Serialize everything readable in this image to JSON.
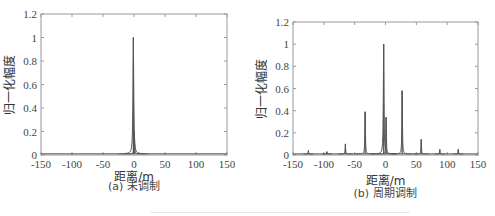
{
  "chart_data": [
    {
      "type": "line",
      "panel": "a",
      "caption": "(a) 未调制",
      "title": "",
      "xlabel": "距离/m",
      "ylabel": "归一化幅度",
      "xlim": [
        -150,
        150
      ],
      "ylim": [
        0,
        1.2
      ],
      "xticks": [
        "-150",
        "-100",
        "-50",
        "0",
        "50",
        "100",
        "150"
      ],
      "yticks": [
        "0",
        "0.2",
        "0.4",
        "0.6",
        "0.8",
        "1",
        "1.2"
      ],
      "grid": false,
      "peaks": [
        {
          "x": -1,
          "y": 1.0,
          "width": 6
        },
        {
          "x": 0.5,
          "y": 0.2,
          "width": 4
        }
      ]
    },
    {
      "type": "line",
      "panel": "b",
      "caption": "(b) 周期调制",
      "title": "",
      "xlabel": "距离/m",
      "ylabel": "归一化幅度",
      "xlim": [
        -150,
        150
      ],
      "ylim": [
        0,
        1.2
      ],
      "xticks": [
        "-150",
        "-100",
        "-50",
        "0",
        "50",
        "100",
        "150"
      ],
      "yticks": [
        "0",
        "0.2",
        "0.4",
        "0.6",
        "0.8",
        "1",
        "1.2"
      ],
      "grid": false,
      "peaks": [
        {
          "x": -125,
          "y": 0.04,
          "width": 2
        },
        {
          "x": -95,
          "y": 0.03,
          "width": 2
        },
        {
          "x": -65,
          "y": 0.1,
          "width": 3
        },
        {
          "x": -33,
          "y": 0.39,
          "width": 4
        },
        {
          "x": -3,
          "y": 1.0,
          "width": 5
        },
        {
          "x": 1,
          "y": 0.34,
          "width": 4
        },
        {
          "x": 27,
          "y": 0.58,
          "width": 4
        },
        {
          "x": 58,
          "y": 0.14,
          "width": 3
        },
        {
          "x": 88,
          "y": 0.05,
          "width": 2
        },
        {
          "x": 118,
          "y": 0.05,
          "width": 2
        }
      ]
    }
  ]
}
